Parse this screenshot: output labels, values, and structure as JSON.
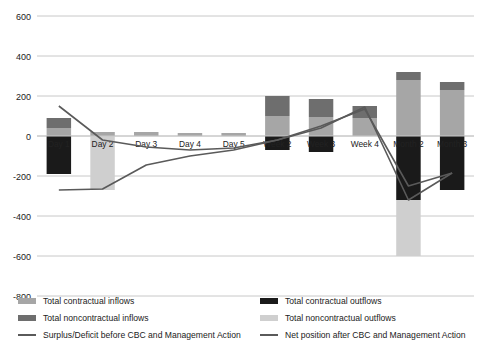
{
  "chart_data": {
    "type": "bar",
    "title": "",
    "subtitle": "",
    "xlabel": "",
    "ylabel": "",
    "ylim": [
      -800,
      600
    ],
    "yticks": [
      600,
      400,
      200,
      0,
      -200,
      -400,
      -600,
      -800
    ],
    "ytick_labels": [
      "600",
      "400",
      "200",
      "0",
      "-200",
      "-400",
      "-600",
      "-800"
    ],
    "grid": true,
    "legend_position": "bottom",
    "stacked": true,
    "categories": [
      "Day 1",
      "Day 2",
      "Day 3",
      "Day 4",
      "Day 5",
      "Week 2",
      "Week 3",
      "Week 4",
      "Month 2",
      "Month 3"
    ],
    "series": [
      {
        "name": "Total contractual inflows",
        "type": "bar",
        "color": "#a6a6a6",
        "values": [
          40,
          20,
          20,
          15,
          15,
          100,
          95,
          90,
          280,
          230
        ]
      },
      {
        "name": "Total noncontractual inflows",
        "type": "bar",
        "color": "#6e6e6e",
        "values": [
          50,
          0,
          0,
          0,
          0,
          100,
          90,
          60,
          40,
          40
        ]
      },
      {
        "name": "Total contractual  outflows",
        "type": "bar",
        "color": "#1a1a1a",
        "values": [
          -190,
          0,
          0,
          0,
          0,
          -70,
          -80,
          0,
          -320,
          -270
        ]
      },
      {
        "name": "Total noncontractual outflows",
        "type": "bar",
        "color": "#cfcfcf",
        "values": [
          0,
          -270,
          0,
          0,
          0,
          0,
          0,
          0,
          -280,
          0
        ]
      },
      {
        "name": "Surplus/Deficit before CBC and Management Action",
        "type": "line",
        "color": "#5a5a5a",
        "values": [
          150,
          -20,
          -55,
          -70,
          -60,
          -20,
          40,
          145,
          -320,
          -185
        ]
      },
      {
        "name": "Net position after CBC and Management Action",
        "type": "line",
        "color": "#5a5a5a",
        "values": [
          -270,
          -265,
          -145,
          -100,
          -70,
          -20,
          50,
          135,
          -250,
          -185
        ]
      }
    ]
  },
  "legend": {
    "left": [
      {
        "label": "Total contractual inflows",
        "marker": "swatch",
        "color": "#a6a6a6"
      },
      {
        "label": "Total noncontractual inflows",
        "marker": "swatch",
        "color": "#6e6e6e"
      },
      {
        "label": "Surplus/Deficit before CBC and Management Action",
        "marker": "line",
        "color": "#5a5a5a"
      }
    ],
    "right": [
      {
        "label": "Total contractual  outflows",
        "marker": "swatch",
        "color": "#1a1a1a"
      },
      {
        "label": "Total noncontractual outflows",
        "marker": "swatch",
        "color": "#cfcfcf"
      },
      {
        "label": "Net position after CBC and Management Action",
        "marker": "line",
        "color": "#5a5a5a"
      }
    ]
  },
  "colors": {
    "contractual_inflows": "#a6a6a6",
    "noncontractual_inflows": "#6e6e6e",
    "contractual_outflows": "#1a1a1a",
    "noncontractual_outflows": "#cfcfcf",
    "line": "#5a5a5a",
    "gridline": "#c8c8c8",
    "axis_text": "#222222"
  }
}
